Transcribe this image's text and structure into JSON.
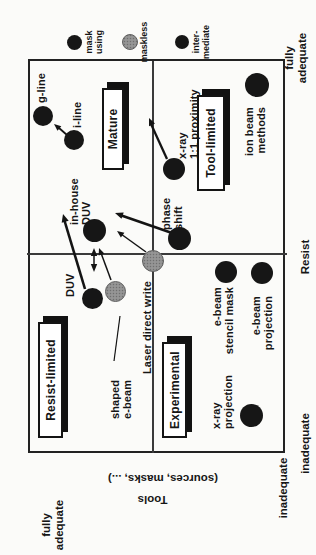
{
  "legend": {
    "items": [
      {
        "name": "mask-using",
        "style": "dark",
        "label": "mask\nusing"
      },
      {
        "name": "maskless",
        "style": "gray",
        "label": "maskless"
      },
      {
        "name": "intermediate",
        "style": "dark",
        "label": "inter-\nmediate"
      }
    ]
  },
  "axes": {
    "tools": {
      "title": "Tools",
      "subtitle": "(sources, masks, ...)",
      "top_label": "fully\nadequate",
      "bottom_label": "inadequate"
    },
    "resist": {
      "title": "Resist",
      "left_label": "inadequate",
      "right_label": "fully\nadequate"
    }
  },
  "quadrants": {
    "resist_limited": "Resist-limited",
    "mature": "Mature",
    "experimental": "Experimental",
    "tool_limited": "Tool-limited"
  },
  "points": {
    "g_line": "g-line",
    "i_line": "i-line",
    "in_house_duv": "in-house\nDUV",
    "duv": "DUV",
    "shaped_e_beam": "shaped\ne-beam",
    "laser_direct_write": "Laser direct write",
    "phase_shift": "phase\nshift",
    "x_ray_proximity": "x-ray\n1:1 proximity",
    "ion_beam_methods": "ion beam\nmethods",
    "e_beam_stencil_mask": "e-beam\nstencil mask",
    "e_beam_projection": "e-beam\nprojection",
    "x_ray_projection": "x-ray\nprojection"
  },
  "colors": {
    "ink": "#161616",
    "paper": "#fbfbf9",
    "maskless_fill": "#a6a6a6"
  }
}
